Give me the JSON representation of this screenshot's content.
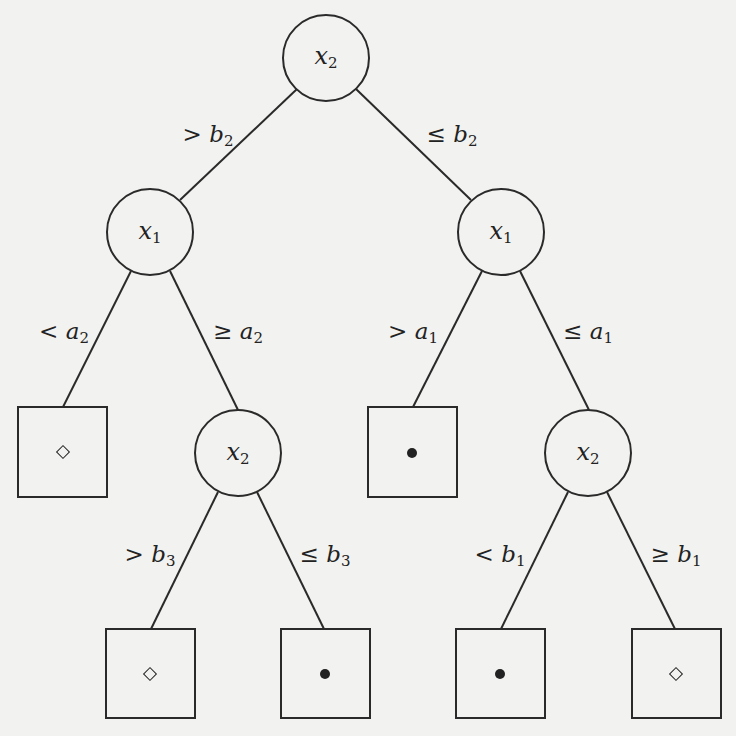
{
  "diagram": {
    "type": "decision-tree",
    "nodes": {
      "root": {
        "var": "x",
        "sub": "2"
      },
      "left_x1": {
        "var": "x",
        "sub": "1"
      },
      "right_x1": {
        "var": "x",
        "sub": "1"
      },
      "left_x2": {
        "var": "x",
        "sub": "2"
      },
      "right_x2": {
        "var": "x",
        "sub": "2"
      }
    },
    "edges": {
      "root_left": {
        "op": ">",
        "var": "b",
        "sub": "2"
      },
      "root_right": {
        "op": "≤",
        "var": "b",
        "sub": "2"
      },
      "lx1_left": {
        "op": "<",
        "var": "a",
        "sub": "2"
      },
      "lx1_right": {
        "op": "≥",
        "var": "a",
        "sub": "2"
      },
      "rx1_left": {
        "op": ">",
        "var": "a",
        "sub": "1"
      },
      "rx1_right": {
        "op": "≤",
        "var": "a",
        "sub": "1"
      },
      "lx2_left": {
        "op": ">",
        "var": "b",
        "sub": "3"
      },
      "lx2_right": {
        "op": "≤",
        "var": "b",
        "sub": "3"
      },
      "rx2_left": {
        "op": "<",
        "var": "b",
        "sub": "1"
      },
      "rx2_right": {
        "op": "≥",
        "var": "b",
        "sub": "1"
      }
    },
    "leaves": [
      {
        "id": "leaf-1",
        "class": "diamond"
      },
      {
        "id": "leaf-2",
        "class": "dot"
      },
      {
        "id": "leaf-3",
        "class": "diamond"
      },
      {
        "id": "leaf-4",
        "class": "dot"
      },
      {
        "id": "leaf-5",
        "class": "dot"
      },
      {
        "id": "leaf-6",
        "class": "diamond"
      }
    ]
  }
}
